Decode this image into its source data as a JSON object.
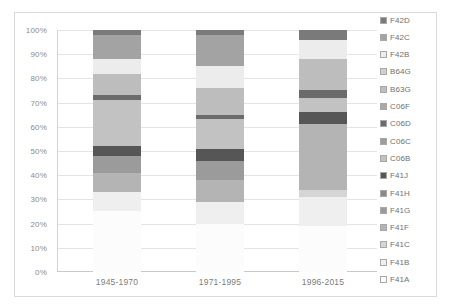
{
  "chart_data": {
    "type": "bar",
    "subtype": "stacked-100-percent",
    "title": "",
    "xlabel": "",
    "ylabel": "",
    "ylim": [
      0,
      100
    ],
    "ytick_labels": [
      "0%",
      "10%",
      "20%",
      "30%",
      "40%",
      "50%",
      "60%",
      "70%",
      "80%",
      "90%",
      "100%"
    ],
    "ytick_values": [
      0,
      10,
      20,
      30,
      40,
      50,
      60,
      70,
      80,
      90,
      100
    ],
    "grid": true,
    "legend_position": "right",
    "categories": [
      "1945-1970",
      "1971-1995",
      "1996-2015"
    ],
    "series": [
      {
        "name": "F41A",
        "color": "#fcfcfc",
        "values": [
          25,
          20,
          19
        ]
      },
      {
        "name": "F41B",
        "color": "#efefef",
        "values": [
          8,
          9,
          12
        ]
      },
      {
        "name": "F41C",
        "color": "#d5d5d5",
        "values": [
          0,
          0,
          3
        ]
      },
      {
        "name": "F41F",
        "color": "#b4b4b4",
        "values": [
          8,
          9,
          27
        ]
      },
      {
        "name": "F41G",
        "color": "#9b9b9b",
        "values": [
          7,
          8,
          0
        ]
      },
      {
        "name": "F41H",
        "color": "#8a8a8a",
        "values": [
          0,
          0,
          0
        ]
      },
      {
        "name": "F41J",
        "color": "#565656",
        "values": [
          4,
          5,
          5
        ]
      },
      {
        "name": "C06B",
        "color": "#c2c2c2",
        "values": [
          19,
          12,
          6
        ]
      },
      {
        "name": "C06C",
        "color": "#9d9d9d",
        "values": [
          0,
          0,
          0
        ]
      },
      {
        "name": "C06D",
        "color": "#6b6b6b",
        "values": [
          2,
          2,
          3
        ]
      },
      {
        "name": "C06F",
        "color": "#a9a9a9",
        "values": [
          0,
          0,
          0
        ]
      },
      {
        "name": "B63G",
        "color": "#bdbdbd",
        "values": [
          9,
          11,
          13
        ]
      },
      {
        "name": "B64G",
        "color": "#d0d0d0",
        "values": [
          0,
          0,
          0
        ]
      },
      {
        "name": "F42B",
        "color": "#ececec",
        "values": [
          6,
          9,
          8
        ]
      },
      {
        "name": "F42C",
        "color": "#a3a3a3",
        "values": [
          10,
          13,
          0
        ]
      },
      {
        "name": "F42D",
        "color": "#7a7a7a",
        "values": [
          2,
          2,
          4
        ]
      }
    ],
    "legend_order_top_to_bottom": [
      "F42D",
      "F42C",
      "F42B",
      "B64G",
      "B63G",
      "C06F",
      "C06D",
      "C06C",
      "C06B",
      "F41J",
      "F41H",
      "F41G",
      "F41F",
      "F41C",
      "F41B",
      "F41A"
    ],
    "stack_order_bottom_to_top": [
      "F41A",
      "F41B",
      "F41C",
      "F41F",
      "F41G",
      "F41H",
      "F41J",
      "C06B",
      "C06C",
      "C06D",
      "C06F",
      "B63G",
      "B64G",
      "F42B",
      "F42C",
      "F42D"
    ],
    "bar_segments": [
      {
        "category": "1945-1970",
        "segments_bottom_to_top": [
          {
            "name": "F41A",
            "value": 25,
            "color": "#fcfcfc"
          },
          {
            "name": "F41B",
            "value": 8,
            "color": "#efefef"
          },
          {
            "name": "F41F",
            "value": 8,
            "color": "#b4b4b4"
          },
          {
            "name": "F41G",
            "value": 7,
            "color": "#9b9b9b"
          },
          {
            "name": "F41J",
            "value": 4,
            "color": "#565656"
          },
          {
            "name": "C06B",
            "value": 19,
            "color": "#c2c2c2"
          },
          {
            "name": "C06D",
            "value": 2,
            "color": "#6b6b6b"
          },
          {
            "name": "B63G",
            "value": 9,
            "color": "#bdbdbd"
          },
          {
            "name": "F42B",
            "value": 6,
            "color": "#ececec"
          },
          {
            "name": "F42C",
            "value": 10,
            "color": "#a3a3a3"
          },
          {
            "name": "F42D",
            "value": 2,
            "color": "#7a7a7a"
          }
        ]
      },
      {
        "category": "1971-1995",
        "segments_bottom_to_top": [
          {
            "name": "F41A",
            "value": 20,
            "color": "#fcfcfc"
          },
          {
            "name": "F41B",
            "value": 9,
            "color": "#efefef"
          },
          {
            "name": "F41F",
            "value": 9,
            "color": "#b4b4b4"
          },
          {
            "name": "F41G",
            "value": 8,
            "color": "#9b9b9b"
          },
          {
            "name": "F41J",
            "value": 5,
            "color": "#565656"
          },
          {
            "name": "C06B",
            "value": 12,
            "color": "#c2c2c2"
          },
          {
            "name": "C06D",
            "value": 2,
            "color": "#6b6b6b"
          },
          {
            "name": "B63G",
            "value": 11,
            "color": "#bdbdbd"
          },
          {
            "name": "F42B",
            "value": 9,
            "color": "#ececec"
          },
          {
            "name": "F42C",
            "value": 13,
            "color": "#a3a3a3"
          },
          {
            "name": "F42D",
            "value": 2,
            "color": "#7a7a7a"
          }
        ]
      },
      {
        "category": "1996-2015",
        "segments_bottom_to_top": [
          {
            "name": "F41A",
            "value": 19,
            "color": "#fcfcfc"
          },
          {
            "name": "F41B",
            "value": 12,
            "color": "#efefef"
          },
          {
            "name": "F41C",
            "value": 3,
            "color": "#d5d5d5"
          },
          {
            "name": "F41F",
            "value": 27,
            "color": "#b4b4b4"
          },
          {
            "name": "F41J",
            "value": 5,
            "color": "#565656"
          },
          {
            "name": "C06B",
            "value": 6,
            "color": "#c2c2c2"
          },
          {
            "name": "C06D",
            "value": 3,
            "color": "#6b6b6b"
          },
          {
            "name": "B63G",
            "value": 13,
            "color": "#bdbdbd"
          },
          {
            "name": "F42B",
            "value": 8,
            "color": "#ececec"
          },
          {
            "name": "F42D",
            "value": 4,
            "color": "#7a7a7a"
          }
        ]
      }
    ]
  }
}
